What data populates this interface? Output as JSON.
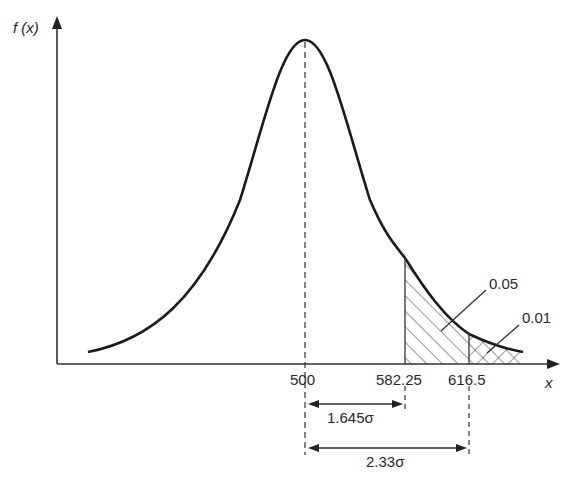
{
  "diagram": {
    "type": "normal-distribution-curve",
    "y_axis_label": "f (x)",
    "x_axis_label": "x",
    "mean_label": "500",
    "tick_labels": [
      "500",
      "582.25",
      "616.5"
    ],
    "regions": [
      {
        "label": "0.05",
        "from": "582.25",
        "to": "right tail"
      },
      {
        "label": "0.01",
        "from": "616.5",
        "to": "right tail"
      }
    ],
    "dimensions": [
      {
        "label": "1.645σ",
        "from": "500",
        "to": "582.25"
      },
      {
        "label": "2.33σ",
        "from": "500",
        "to": "616.5"
      }
    ],
    "colors": {
      "ink": "#222222",
      "background": "#ffffff"
    }
  }
}
